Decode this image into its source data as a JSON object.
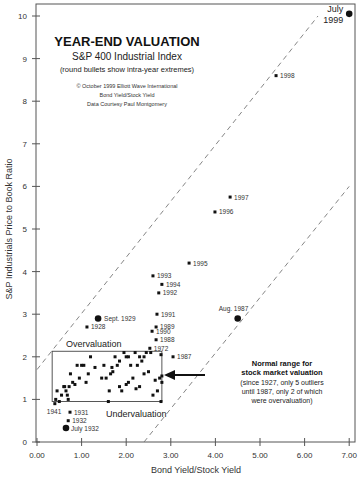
{
  "chart_data": {
    "type": "scatter",
    "title": "YEAR-END VALUATION",
    "subtitle": "S&P 400 Industrial Index",
    "subtitle2": "(round bullets show intra-year extremes)",
    "credits": [
      "© October 1999 Elliott Wave International",
      "Bond Yield/Stock Yield",
      "Data Courtesy Paul Montgomery"
    ],
    "xlabel": "Bond Yield/Stock Yield",
    "ylabel": "S&P Industrials Price to Book Ratio",
    "xlim": [
      0,
      7
    ],
    "ylim": [
      0,
      10
    ],
    "x_ticks": [
      "0.00",
      "1.00",
      "2.00",
      "3.00",
      "4.00",
      "5.00",
      "6.00",
      "7.00"
    ],
    "y_ticks": [
      "0",
      "1",
      "2",
      "3",
      "4",
      "5",
      "6",
      "7",
      "8",
      "9",
      "10"
    ],
    "grid": false,
    "labeled_points": [
      {
        "label": "July 1999",
        "x": 7.0,
        "y": 10.05,
        "marker": "round"
      },
      {
        "label": "1998",
        "x": 5.36,
        "y": 8.6,
        "marker": "square"
      },
      {
        "label": "1997",
        "x": 4.33,
        "y": 5.75,
        "marker": "square"
      },
      {
        "label": "1996",
        "x": 3.99,
        "y": 5.4,
        "marker": "square"
      },
      {
        "label": "1995",
        "x": 3.41,
        "y": 4.2,
        "marker": "square"
      },
      {
        "label": "1993",
        "x": 2.6,
        "y": 3.9,
        "marker": "square"
      },
      {
        "label": "1994",
        "x": 2.8,
        "y": 3.7,
        "marker": "square"
      },
      {
        "label": "1992",
        "x": 2.73,
        "y": 3.5,
        "marker": "square"
      },
      {
        "label": "1991",
        "x": 2.69,
        "y": 3.0,
        "marker": "square"
      },
      {
        "label": "1989",
        "x": 2.67,
        "y": 2.7,
        "marker": "square"
      },
      {
        "label": "1990",
        "x": 2.58,
        "y": 2.6,
        "marker": "square"
      },
      {
        "label": "1988",
        "x": 2.67,
        "y": 2.4,
        "marker": "square"
      },
      {
        "label": "1972",
        "x": 2.53,
        "y": 2.2,
        "marker": "square"
      },
      {
        "label": "1987",
        "x": 3.05,
        "y": 2.0,
        "marker": "square"
      },
      {
        "label": "Sept. 1929",
        "x": 1.37,
        "y": 2.9,
        "marker": "round"
      },
      {
        "label": "1928",
        "x": 1.12,
        "y": 2.7,
        "marker": "square"
      },
      {
        "label": "Aug. 1987",
        "x": 4.5,
        "y": 2.9,
        "marker": "round"
      },
      {
        "label": "1931",
        "x": 0.74,
        "y": 0.7,
        "marker": "square"
      },
      {
        "label": "1932",
        "x": 0.7,
        "y": 0.5,
        "marker": "square"
      },
      {
        "label": "July 1932",
        "x": 0.65,
        "y": 0.33,
        "marker": "round"
      },
      {
        "label": "1941",
        "x": 0.4,
        "y": 0.9,
        "marker": "square"
      }
    ],
    "unlabeled_points": [
      [
        0.42,
        1.0
      ],
      [
        0.45,
        1.2
      ],
      [
        0.5,
        0.95
      ],
      [
        0.55,
        1.1
      ],
      [
        0.6,
        1.3
      ],
      [
        0.62,
        1.3
      ],
      [
        0.65,
        1.2
      ],
      [
        0.68,
        1.1
      ],
      [
        0.7,
        1.0
      ],
      [
        0.72,
        1.3
      ],
      [
        0.75,
        1.6
      ],
      [
        0.8,
        1.4
      ],
      [
        0.85,
        1.35
      ],
      [
        0.9,
        1.8
      ],
      [
        0.95,
        1.5
      ],
      [
        1.0,
        1.8
      ],
      [
        1.05,
        1.8
      ],
      [
        1.1,
        1.4
      ],
      [
        1.15,
        1.6
      ],
      [
        1.2,
        2.0
      ],
      [
        1.3,
        1.75
      ],
      [
        1.45,
        1.5
      ],
      [
        1.55,
        1.5
      ],
      [
        1.6,
        0.95
      ],
      [
        1.62,
        1.2
      ],
      [
        1.68,
        1.75
      ],
      [
        1.75,
        2.0
      ],
      [
        1.8,
        1.8
      ],
      [
        1.85,
        1.9
      ],
      [
        1.95,
        2.1
      ],
      [
        2.0,
        2.0
      ],
      [
        2.05,
        2.0
      ],
      [
        2.1,
        1.8
      ],
      [
        2.2,
        2.1
      ],
      [
        2.25,
        1.8
      ],
      [
        2.3,
        2.0
      ],
      [
        2.35,
        1.9
      ],
      [
        2.4,
        1.6
      ],
      [
        2.45,
        2.1
      ],
      [
        2.55,
        2.1
      ],
      [
        2.6,
        1.1
      ],
      [
        2.65,
        1.45
      ],
      [
        2.7,
        1.2
      ],
      [
        2.75,
        1.5
      ],
      [
        2.78,
        2.05
      ],
      [
        1.85,
        1.3
      ],
      [
        1.9,
        1.2
      ],
      [
        2.0,
        1.35
      ],
      [
        2.05,
        1.4
      ],
      [
        2.15,
        1.5
      ],
      [
        2.22,
        1.25
      ],
      [
        2.3,
        1.3
      ],
      [
        2.4,
        2.0
      ],
      [
        2.5,
        1.65
      ],
      [
        2.8,
        1.55
      ],
      [
        2.8,
        1.4
      ],
      [
        2.78,
        0.95
      ],
      [
        1.65,
        1.6
      ],
      [
        1.7,
        1.65
      ],
      [
        1.5,
        1.8
      ]
    ],
    "annotations": {
      "overvaluation_label": "Overvaluation",
      "undervaluation_label": "Undervaluation",
      "normal_range_box": {
        "x0": 0.34,
        "x1": 2.8,
        "y0": 0.95,
        "y1": 2.13
      },
      "note_lines_bold": [
        "Normal range for",
        "stock market valuation"
      ],
      "note_lines": [
        "(since 1927, only 5 outliers",
        "until 1987, only 2 of which",
        "were overvaluation)"
      ],
      "upper_bound_line": {
        "x0": 0.0,
        "y0": 1.7,
        "x1": 6.3,
        "y1": 10.0
      },
      "lower_bound_line": {
        "x0": 2.4,
        "y0": 0.0,
        "x1": 7.0,
        "y1": 6.0
      }
    }
  }
}
